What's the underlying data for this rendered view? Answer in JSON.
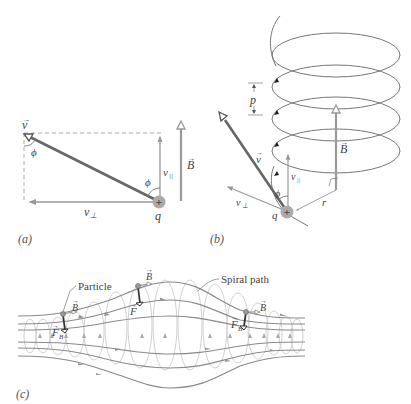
{
  "figure": {
    "panels": [
      {
        "id": "a",
        "label": "(a)",
        "symbols": {
          "velocity": "v",
          "angle_top": "ϕ",
          "angle_bottom": "ϕ",
          "v_parallel": "v",
          "v_parallel_sub": "||",
          "v_perp": "v",
          "v_perp_sub": "⊥",
          "field": "B",
          "charge": "q",
          "charge_sign": "+"
        }
      },
      {
        "id": "b",
        "label": "(b)",
        "symbols": {
          "pitch": "p",
          "field": "B",
          "velocity": "v",
          "v_parallel": "v",
          "v_parallel_sub": "||",
          "v_perp": "v",
          "v_perp_sub": "⊥",
          "angle": "ϕ",
          "radius": "r",
          "charge": "q",
          "charge_sign": "+"
        }
      },
      {
        "id": "c",
        "label": "(c)",
        "annotations": {
          "particle": "Particle",
          "spiral_path": "Spiral path"
        },
        "symbols": {
          "field_1": "B",
          "field_2": "B",
          "field_3": "B",
          "force_1": "F",
          "force_1_sub": "B",
          "force_2": "F",
          "force_3": "F",
          "force_3_sub": "B"
        }
      }
    ],
    "colors": {
      "line_dark": "#6b6b6b",
      "line_field": "#9a9a9a",
      "line_light": "#c8c8c8",
      "text": "#444444",
      "charge_fill": "#a8a8a8"
    }
  }
}
